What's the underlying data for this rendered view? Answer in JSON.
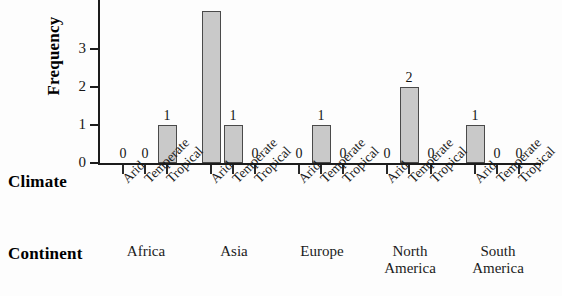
{
  "chart_data": {
    "type": "bar",
    "title": "",
    "xlabel": "Climate",
    "ylabel": "Frequency",
    "group_axis_label": "Continent",
    "ylim": [
      0,
      4
    ],
    "yticks": [
      "0",
      "1",
      "2",
      "3"
    ],
    "ytick_values": [
      0,
      1,
      2,
      3
    ],
    "grid": false,
    "legend": "none",
    "categories": [
      "Arid",
      "Temperate",
      "Tropical"
    ],
    "groups": [
      "Africa",
      "Asia",
      "Europe",
      "North America",
      "South America"
    ],
    "note": "Asia / Arid bar is clipped by the top edge of the image",
    "series": [
      {
        "name": "Africa",
        "values": [
          0,
          0,
          1
        ]
      },
      {
        "name": "Asia",
        "values": [
          4,
          1,
          0
        ]
      },
      {
        "name": "Europe",
        "values": [
          0,
          1,
          0
        ]
      },
      {
        "name": "North America",
        "values": [
          0,
          2,
          0
        ]
      },
      {
        "name": "South America",
        "values": [
          1,
          0,
          0
        ]
      }
    ],
    "bar_color": "#c9c9c9",
    "bar_edge_color": "#4a4a4a",
    "axis_color": "#1c1c1c"
  },
  "axes": {
    "y_title": "Frequency",
    "climate_title": "Climate",
    "continent_title": "Continent"
  },
  "yticks": [
    {
      "label": "3",
      "value": 3
    },
    {
      "label": "2",
      "value": 2
    },
    {
      "label": "1",
      "value": 1
    },
    {
      "label": "0",
      "value": 0
    }
  ],
  "bars": [
    {
      "group": "Africa",
      "climate": "Arid",
      "label": "0",
      "value": 0
    },
    {
      "group": "Africa",
      "climate": "Temperate",
      "label": "0",
      "value": 0
    },
    {
      "group": "Africa",
      "climate": "Tropical",
      "label": "1",
      "value": 1
    },
    {
      "group": "Asia",
      "climate": "Arid",
      "label": "",
      "value": 4
    },
    {
      "group": "Asia",
      "climate": "Temperate",
      "label": "1",
      "value": 1
    },
    {
      "group": "Asia",
      "climate": "Tropical",
      "label": "0",
      "value": 0
    },
    {
      "group": "Europe",
      "climate": "Arid",
      "label": "0",
      "value": 0
    },
    {
      "group": "Europe",
      "climate": "Temperate",
      "label": "1",
      "value": 1
    },
    {
      "group": "Europe",
      "climate": "Tropical",
      "label": "0",
      "value": 0
    },
    {
      "group": "North America",
      "climate": "Arid",
      "label": "0",
      "value": 0
    },
    {
      "group": "North America",
      "climate": "Temperate",
      "label": "2",
      "value": 2
    },
    {
      "group": "North America",
      "climate": "Tropical",
      "label": "0",
      "value": 0
    },
    {
      "group": "South America",
      "climate": "Arid",
      "label": "1",
      "value": 1
    },
    {
      "group": "South America",
      "climate": "Temperate",
      "label": "0",
      "value": 0
    },
    {
      "group": "South America",
      "climate": "Tropical",
      "label": "0",
      "value": 0
    }
  ],
  "climate_ticks": [
    "Arid",
    "Temperate",
    "Tropical",
    "Arid",
    "Temperate",
    "Tropical",
    "Arid",
    "Temperate",
    "Tropical",
    "Arid",
    "Temperate",
    "Tropical",
    "Arid",
    "Temperate",
    "Tropical"
  ],
  "continents": [
    {
      "line1": "Africa",
      "line2": ""
    },
    {
      "line1": "Asia",
      "line2": ""
    },
    {
      "line1": "Europe",
      "line2": ""
    },
    {
      "line1": "North",
      "line2": "America"
    },
    {
      "line1": "South",
      "line2": "America"
    }
  ]
}
